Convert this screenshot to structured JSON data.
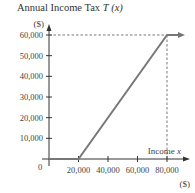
{
  "chart_data": {
    "type": "line",
    "title_main": "Annual Income Tax ",
    "title_func": "T",
    "title_arg": "(x)",
    "ylabel": "($)",
    "xlabel": "Income x",
    "xlabel_text": "Income ",
    "xlabel_var": "x",
    "xunit": "($)",
    "origin_label": "0",
    "x_ticks": [
      20000,
      40000,
      60000,
      80000
    ],
    "x_tick_labels": [
      "20,000",
      "40,000",
      "60,000",
      "80,000"
    ],
    "y_ticks": [
      10000,
      20000,
      30000,
      40000,
      50000,
      60000
    ],
    "y_tick_labels": [
      "10,000",
      "20,000",
      "30,000",
      "40,000",
      "50,000",
      "60,000"
    ],
    "xlim": [
      0,
      90000
    ],
    "ylim": [
      0,
      65000
    ],
    "series": [
      {
        "name": "T(x)",
        "x": [
          0,
          20000,
          80000,
          90000
        ],
        "y": [
          0,
          0,
          60000,
          60000
        ],
        "arrow_end": true
      }
    ],
    "reference_lines": [
      {
        "type": "horizontal",
        "y": 60000,
        "from_x": 0,
        "to_x": 80000,
        "style": "dashed"
      },
      {
        "type": "vertical",
        "x": 80000,
        "from_y": 0,
        "to_y": 60000,
        "style": "dashed"
      }
    ],
    "grid": false,
    "legend": null,
    "colors": {
      "line": "#777777",
      "axis": "#333333",
      "dashed": "#555555"
    }
  }
}
